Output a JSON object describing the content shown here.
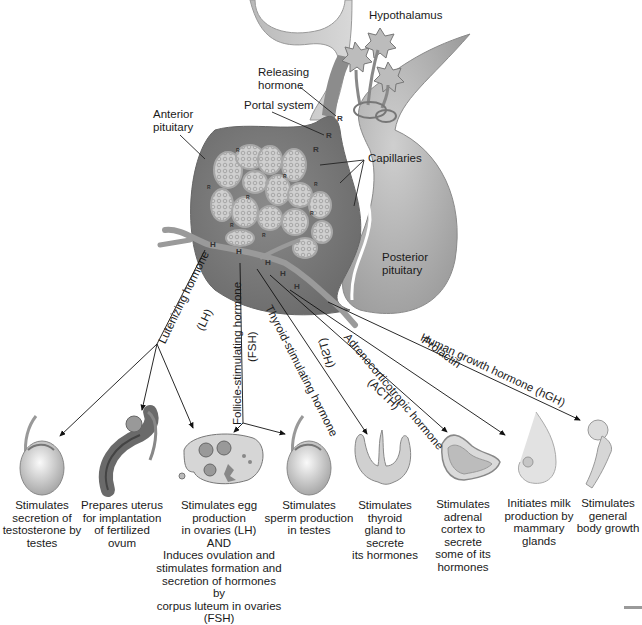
{
  "diagram": {
    "structures": {
      "hypothalamus": "Hypothalamus",
      "releasing_hormone": "Releasing\nhormone",
      "portal_system": "Portal system",
      "anterior_pituitary": "Anterior\npituitary",
      "capillaries": "Capillaries",
      "posterior_pituitary": "Posterior\npituitary"
    },
    "markers": {
      "releasing": "R",
      "hormone": "H"
    },
    "hormones": [
      {
        "id": "lh",
        "name": "Lutenizing hormone",
        "abbr": "(LH)"
      },
      {
        "id": "fsh",
        "name": "Follicle-stimulating hormone",
        "abbr": "(FSH)"
      },
      {
        "id": "tsh",
        "name": "Thyroid-stimulating hormone",
        "abbr": "(TSH)"
      },
      {
        "id": "acth",
        "name": "Adrenocorticotropic hormone",
        "abbr": "(ACTH)"
      },
      {
        "id": "prolactin",
        "name": "Prolactin",
        "abbr": ""
      },
      {
        "id": "hgh",
        "name": "Human growth hormone (hGH)",
        "abbr": ""
      }
    ],
    "targets": [
      {
        "organ": "testis",
        "icon": "testis-icon",
        "caption": "Stimulates\nsecretion of\ntestosterone by\ntestes"
      },
      {
        "organ": "uterus",
        "icon": "uterus-icon",
        "caption": "Prepares uterus\nfor implantation\nof fertilized ovum"
      },
      {
        "organ": "ovary",
        "icon": "ovary-icon",
        "caption": "Stimulates egg\nproduction\nin ovaries (LH)\nAND\nInduces ovulation and\nstimulates formation and\nsecretion of hormones by\ncorpus luteum in ovaries\n(FSH)"
      },
      {
        "organ": "testis",
        "icon": "testis-icon",
        "caption": "Stimulates\nsperm production\nin testes"
      },
      {
        "organ": "thyroid",
        "icon": "thyroid-icon",
        "caption": "Stimulates\nthyroid\ngland to secrete\nits hormones"
      },
      {
        "organ": "adrenal",
        "icon": "adrenal-gland-icon",
        "caption": "Stimulates\nadrenal\ncortex to\nsecrete\nsome of its\nhormones"
      },
      {
        "organ": "breast",
        "icon": "mammary-gland-icon",
        "caption": "Initiates milk\nproduction by\nmammary\nglands"
      },
      {
        "organ": "bone",
        "icon": "femur-bone-icon",
        "caption": "Stimulates\ngeneral\nbody growth"
      }
    ],
    "colors": {
      "tissue_dark": "#7a7a7a",
      "tissue_mid": "#9e9e9e",
      "tissue_light": "#c8c8c8",
      "line": "#222222",
      "background": "#ffffff"
    }
  }
}
